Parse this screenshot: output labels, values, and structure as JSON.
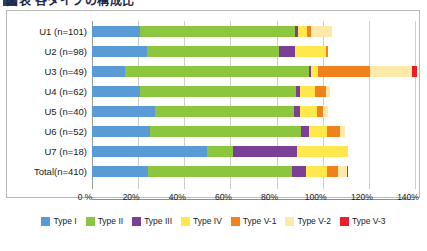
{
  "title": {
    "text": "図表 各タイプの構成比",
    "cut_off": true
  },
  "chart_data": {
    "type": "bar",
    "orientation": "horizontal",
    "stacked": true,
    "title": "",
    "xlabel": "",
    "ylabel": "",
    "xlim": [
      0,
      140
    ],
    "xticks": [
      0,
      20,
      40,
      60,
      80,
      100,
      120,
      140
    ],
    "xtick_labels": [
      "0 %",
      "20%",
      "40%",
      "60%",
      "80%",
      "100%",
      "120%",
      "140%"
    ],
    "grid": true,
    "legend_position": "bottom",
    "categories": [
      "U1 (n=101)",
      "U2 (n=98)",
      "U3 (n=49)",
      "U4 (n=62)",
      "U5 (n=40)",
      "U6 (n=52)",
      "U7 (n=18)",
      "Total(n=410)"
    ],
    "series": [
      {
        "name": "Type I",
        "color": "#5b9bd5",
        "values": [
          20.8,
          23.8,
          14.3,
          20.9,
          27.5,
          25.0,
          50.0,
          24.4
        ]
      },
      {
        "name": "Type II",
        "color": "#8cc63e",
        "values": [
          67.3,
          57.1,
          79.6,
          67.7,
          60.0,
          65.4,
          11.1,
          62.4
        ]
      },
      {
        "name": "Type III",
        "color": "#7b3f98",
        "values": [
          1.0,
          7.1,
          1.0,
          1.6,
          2.5,
          3.8,
          27.8,
          6.1
        ]
      },
      {
        "name": "Type IV",
        "color": "#ffe84d",
        "values": [
          4.0,
          13.3,
          3.1,
          6.5,
          7.5,
          7.7,
          22.2,
          8.8
        ]
      },
      {
        "name": "Type V-1",
        "color": "#f0821e",
        "values": [
          2.0,
          1.0,
          22.4,
          4.8,
          2.5,
          5.8,
          0.0,
          4.9
        ]
      },
      {
        "name": "Type V-2",
        "color": "#fde9a9",
        "values": [
          8.9,
          0.0,
          18.4,
          1.6,
          2.5,
          1.9,
          0.0,
          3.9
        ]
      },
      {
        "name": "Type V-3",
        "color": "#ee1c25",
        "values": [
          0.0,
          0.0,
          2.0,
          0.0,
          0.0,
          0.0,
          0.0,
          0.2
        ]
      }
    ]
  },
  "legend": {
    "items": [
      {
        "label": "Type I",
        "color": "#5b9bd5"
      },
      {
        "label": "Type II",
        "color": "#8cc63e"
      },
      {
        "label": "Type III",
        "color": "#7b3f98"
      },
      {
        "label": "Type IV",
        "color": "#ffe84d"
      },
      {
        "label": "Type V-1",
        "color": "#f0821e"
      },
      {
        "label": "Type V-2",
        "color": "#fde9a9"
      },
      {
        "label": "Type V-3",
        "color": "#ee1c25"
      }
    ]
  },
  "colors": {
    "frame_border": "#b9b9b9",
    "gridline": "#cfcfcf",
    "axis": "#8f8f8f",
    "text": "#1a1a1a"
  }
}
